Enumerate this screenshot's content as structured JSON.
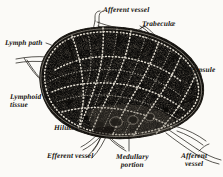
{
  "figure": {
    "style": "engraving",
    "background_color": "#fbfaf7",
    "ink_color": "#16130f",
    "width": 223,
    "height": 177
  },
  "labels": {
    "afferent_vessel_top": "Afferent vessel",
    "trabeculae": "Trabeculæ",
    "lymph_path": "Lymph path",
    "capsule": "Capsule",
    "lymphoid_tissue_line1": "Lymphoid",
    "lymphoid_tissue_line2": "tissue",
    "hilum": "Hilum",
    "efferent_vessel": "Efferent vessel",
    "medullary_line1": "Medullary",
    "medullary_line2": "portion",
    "afferent_vessel_bottom_line1": "Afferent",
    "afferent_vessel_bottom_line2": "vessel"
  },
  "structures": [
    {
      "name": "capsule",
      "description": "outer fibrous envelope of the node"
    },
    {
      "name": "lymphoid-tissue",
      "description": "dense stippled cortical mass"
    },
    {
      "name": "lymph-path",
      "description": "pale sinus channels between lobules"
    },
    {
      "name": "trabeculae",
      "description": "fibrous partitions entering from capsule"
    },
    {
      "name": "medullary-portion",
      "description": "inner medullary cords near hilum"
    },
    {
      "name": "hilum",
      "description": "indentation where efferent vessels leave"
    },
    {
      "name": "afferent-vessel",
      "description": "vessels entering the node"
    },
    {
      "name": "efferent-vessel",
      "description": "vessels leaving the node at the hilum"
    }
  ]
}
